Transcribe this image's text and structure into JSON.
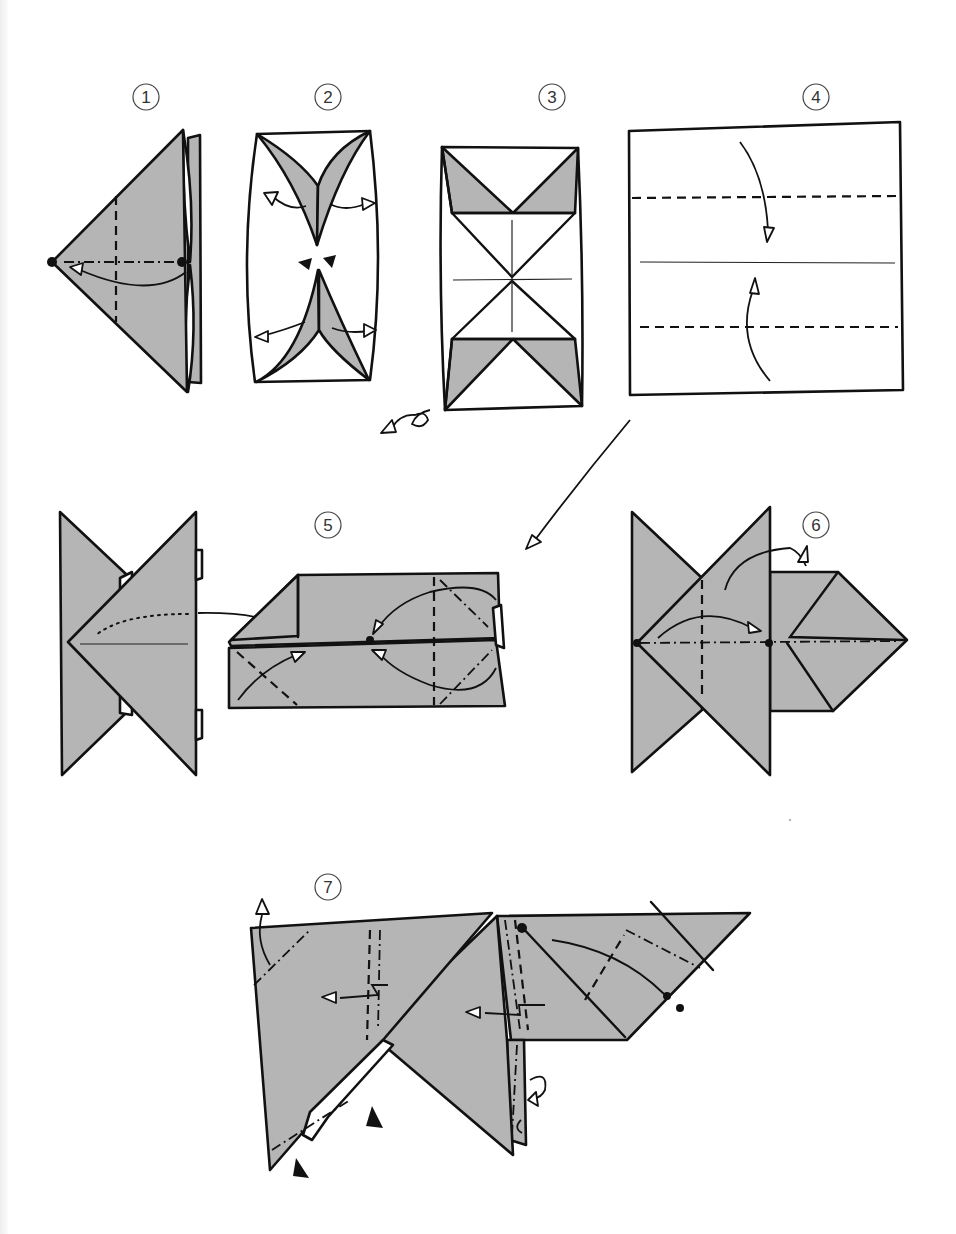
{
  "diagram": {
    "type": "origami-instruction-sequence",
    "colors": {
      "background": "#ffffff",
      "paper_colored_side": "#b5b5b5",
      "paper_white_side": "#ffffff",
      "line": "#111111"
    },
    "steps": [
      {
        "number": "1",
        "label": "1",
        "description": "Triangle base with valley fold marked, dot-to-dot fold arrow"
      },
      {
        "number": "2",
        "label": "2",
        "description": "Open flaps outward, push-in arrows at center"
      },
      {
        "number": "3",
        "label": "3",
        "description": "Result with crease lines; turn over arrow"
      },
      {
        "number": "4",
        "label": "4",
        "description": "Fold top and bottom edges to the center line"
      },
      {
        "number": "5",
        "label": "5",
        "description": "Join the two units; insert flaps"
      },
      {
        "number": "6",
        "label": "6",
        "description": "Fold along mountain/valley lines dot to dot"
      },
      {
        "number": "7",
        "label": "7",
        "description": "Final shaping with inside reverse folds and pleats"
      }
    ],
    "symbols": {
      "turn_over": "turn-over-arrow-icon",
      "push": "push-arrow-icon",
      "fold_arrow": "fold-arrow-icon",
      "valley_fold": "dashed line",
      "mountain_fold": "dash-dot line"
    }
  }
}
